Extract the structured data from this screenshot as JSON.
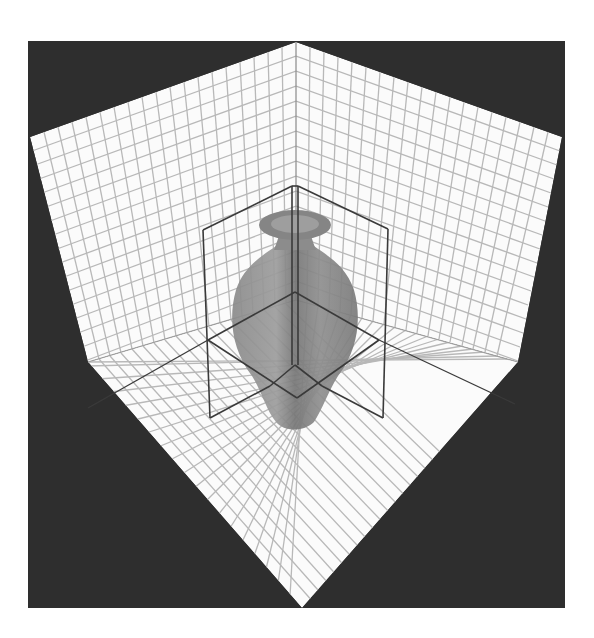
{
  "figure": {
    "colors": {
      "page_background": "#ffffff",
      "frame_background": "#2e2e2e",
      "grid_plane": "#fbfbfb",
      "grid_lines": "#b4b4b4",
      "wireframe": "#3a3a3a",
      "vase_dark": "#6e6e6e",
      "vase_light": "#9a9a9a"
    },
    "scene": {
      "objects": [
        {
          "name": "left-wall",
          "type": "grid-plane"
        },
        {
          "name": "right-wall",
          "type": "grid-plane"
        },
        {
          "name": "floor",
          "type": "grid-plane"
        },
        {
          "name": "vase",
          "type": "solid"
        },
        {
          "name": "bounding-box",
          "type": "wireframe"
        }
      ]
    }
  }
}
